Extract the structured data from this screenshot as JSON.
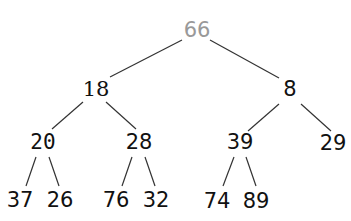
{
  "diagram": {
    "type": "binary-tree",
    "colors": {
      "highlighted_node": "#999999",
      "normal_node": "#111111",
      "edge": "#333333"
    },
    "nodes": [
      {
        "id": "n0",
        "label": "66",
        "x": 197,
        "y": 30,
        "style": "root"
      },
      {
        "id": "n1",
        "label": "18",
        "x": 96,
        "y": 89,
        "style": "serif"
      },
      {
        "id": "n2",
        "label": "8",
        "x": 290,
        "y": 89,
        "style": "sans"
      },
      {
        "id": "n3",
        "label": "20",
        "x": 43,
        "y": 142,
        "style": "mono"
      },
      {
        "id": "n4",
        "label": "28",
        "x": 139,
        "y": 142,
        "style": "sans"
      },
      {
        "id": "n5",
        "label": "39",
        "x": 240,
        "y": 142,
        "style": "sans"
      },
      {
        "id": "n6",
        "label": "29",
        "x": 333,
        "y": 143,
        "style": "sans"
      },
      {
        "id": "n7",
        "label": "37",
        "x": 20,
        "y": 200,
        "style": "sans"
      },
      {
        "id": "n8",
        "label": "26",
        "x": 60,
        "y": 200,
        "style": "sans"
      },
      {
        "id": "n9",
        "label": "76",
        "x": 116,
        "y": 200,
        "style": "sans"
      },
      {
        "id": "n10",
        "label": "32",
        "x": 156,
        "y": 200,
        "style": "sans"
      },
      {
        "id": "n11",
        "label": "74",
        "x": 217,
        "y": 201,
        "style": "sans"
      },
      {
        "id": "n12",
        "label": "89",
        "x": 256,
        "y": 201,
        "style": "sans"
      }
    ],
    "edges": [
      {
        "from": "66",
        "to": "18",
        "x1": 182,
        "y1": 40,
        "x2": 110,
        "y2": 77
      },
      {
        "from": "66",
        "to": "8",
        "x1": 210,
        "y1": 40,
        "x2": 279,
        "y2": 78
      },
      {
        "from": "18",
        "to": "20",
        "x1": 83,
        "y1": 102,
        "x2": 52,
        "y2": 129
      },
      {
        "from": "18",
        "to": "28",
        "x1": 106,
        "y1": 102,
        "x2": 136,
        "y2": 129
      },
      {
        "from": "8",
        "to": "39",
        "x1": 279,
        "y1": 104,
        "x2": 248,
        "y2": 131
      },
      {
        "from": "8",
        "to": "29",
        "x1": 301,
        "y1": 104,
        "x2": 331,
        "y2": 131
      },
      {
        "from": "20",
        "to": "37",
        "x1": 36,
        "y1": 157,
        "x2": 26,
        "y2": 186
      },
      {
        "from": "20",
        "to": "26",
        "x1": 49,
        "y1": 157,
        "x2": 59,
        "y2": 186
      },
      {
        "from": "28",
        "to": "76",
        "x1": 132,
        "y1": 157,
        "x2": 122,
        "y2": 186
      },
      {
        "from": "28",
        "to": "32",
        "x1": 145,
        "y1": 157,
        "x2": 155,
        "y2": 186
      },
      {
        "from": "39",
        "to": "74",
        "x1": 234,
        "y1": 157,
        "x2": 223,
        "y2": 186
      },
      {
        "from": "39",
        "to": "89",
        "x1": 246,
        "y1": 157,
        "x2": 256,
        "y2": 186
      }
    ]
  }
}
